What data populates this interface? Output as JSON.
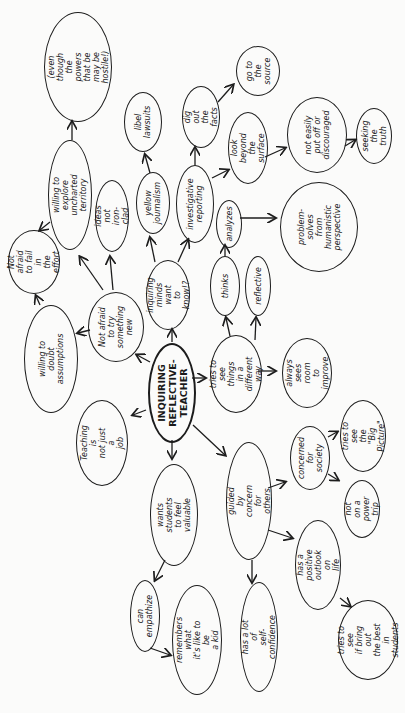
{
  "diagram": {
    "orientation": "rotated -90deg (text reads bottom-to-top)",
    "colors": {
      "ink": "#1c1c1c",
      "paper": "#fbfbfa"
    },
    "nodes": {
      "center": {
        "label": "INQUIRING\nREFLECTIVE-\nTEACHER"
      },
      "not_afraid_new": {
        "label": "Not afraid\nto try\nsomething\nnew"
      },
      "willing_doubt": {
        "label": "willing to doubt\nassumptions"
      },
      "not_afraid_fail": {
        "label": "Not afraid\nto fail in\nthe effort"
      },
      "willing_explore": {
        "label": "willing to explore\nuncharted territory"
      },
      "even_though": {
        "label": "(even though the\npowers that be\nmay be hostile!)"
      },
      "ideas_not_ironclad": {
        "label": "ideas not\niron-clad"
      },
      "inquiring_minds": {
        "label": "inquiring\nminds want\nto know!?"
      },
      "yellow_journalism": {
        "label": "yellow\njournalism"
      },
      "libel_lawsuits": {
        "label": "libel\nlawsuits"
      },
      "investigative_reporting": {
        "label": "investigative\nreporting"
      },
      "dig_out_facts": {
        "label": "dig out\nthe facts"
      },
      "go_to_source": {
        "label": "go to\nthe\nsource"
      },
      "look_beyond": {
        "label": "look beyond\nthe surface"
      },
      "not_easily": {
        "label": "not easily\nput off or\ndiscouraged"
      },
      "seeking_truth": {
        "label": "seeking the\ntruth"
      },
      "analyzes": {
        "label": "analyzes"
      },
      "problem_solves": {
        "label": "problem-\nsolves\nfrom\nhumanistic\nperspective"
      },
      "tries_different": {
        "label": "tries to see\nthings in a\ndifferent way"
      },
      "thinks": {
        "label": "thinks"
      },
      "reflective": {
        "label": "reflective"
      },
      "always_room": {
        "label": "always\nsees room\nto improve"
      },
      "teaching_not_job": {
        "label": "Teaching is\nnot just a\njob"
      },
      "wants_students": {
        "label": "wants students\nto feel valuable"
      },
      "can_empathize": {
        "label": "can\nempathize"
      },
      "remembers_kid": {
        "label": "remembers what\nit's like to be\na kid"
      },
      "guided_concern": {
        "label": "guided by concern\nfor others"
      },
      "self_confidence": {
        "label": "has a lot of\nself-confidence"
      },
      "concerned_society": {
        "label": "concerned\nfor\nsociety"
      },
      "big_picture": {
        "label": "tries to see\nthe \"Big\nPicture\""
      },
      "not_power_trip": {
        "label": "not on a\npower trip"
      },
      "positive_outlook": {
        "label": "has a positive\noutlook on\nlife"
      },
      "bring_out_best": {
        "label": "tries to see\nif bring out\nthe best in\nstudents"
      }
    }
  }
}
